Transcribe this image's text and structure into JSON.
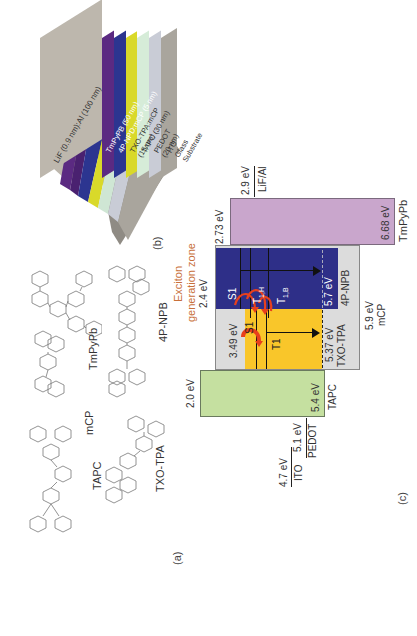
{
  "panels": {
    "a": {
      "label": "(a)"
    },
    "b": {
      "label": "(b)"
    },
    "c": {
      "label": "(c)"
    }
  },
  "molecules": [
    {
      "name": "TAPC"
    },
    {
      "name": "TXO-TPA"
    },
    {
      "name": "mCP"
    },
    {
      "name": "4P-NPB"
    },
    {
      "name": "TmPyPb"
    }
  ],
  "device_stack": {
    "layers": [
      {
        "label": "LiF (0.9 nm):Al (100 nm)",
        "color": "#bdb7ad"
      },
      {
        "label": "TmPyPB (50 nm)",
        "color": "#5b2a82"
      },
      {
        "label": "4P-NPD:mCP (5 nm)",
        "color": "#2c3590"
      },
      {
        "label": "TXO-TPA:mCP (15 nm)",
        "color": "#d9d92a"
      },
      {
        "label": "TAPC (30 nm)",
        "color": "#cfe6d4"
      },
      {
        "label": "PEDOT (20 nm)",
        "color": "#c9ccd6"
      },
      {
        "label": "ITO Glass Substrate",
        "color": "#a9a59d"
      }
    ]
  },
  "energy_diagram": {
    "annotation": {
      "line1": "Exciton",
      "line2": "generation zone",
      "color": "#c8703a"
    },
    "electrodes": [
      {
        "name": "ITO",
        "value": "4.7 eV"
      },
      {
        "name": "PEDOT",
        "value": "5.1 eV"
      },
      {
        "name": "LiF/Al",
        "value": "2.9 eV"
      }
    ],
    "materials": [
      {
        "name": "TAPC",
        "lumo": "2.0 eV",
        "homo": "5.4 eV",
        "color": "#c5e0a0"
      },
      {
        "name": "mCP",
        "lumo": "2.4 eV",
        "homo": "5.9 eV",
        "color": "#dcdcdc"
      },
      {
        "name": "TXO-TPA",
        "lumo": "3.49 eV",
        "homo": "5.37 eV",
        "color": "#f9c62a"
      },
      {
        "name": "4P-NPB",
        "lumo": "2.4 eV",
        "homo": "5.7 eV",
        "color": "#2e2f88"
      },
      {
        "name": "TmPyPb",
        "lumo": "2.73 eV",
        "homo": "6.68 eV",
        "color": "#c9a6cc"
      }
    ],
    "states": {
      "s1_host": "S1",
      "t1h": "T",
      "t1h_sub": "1,H",
      "t1b": "T",
      "t1b_sub": "1,B",
      "s1_guest": "S1",
      "t1_guest": "T1"
    },
    "arrow_color": "#e8401c"
  }
}
